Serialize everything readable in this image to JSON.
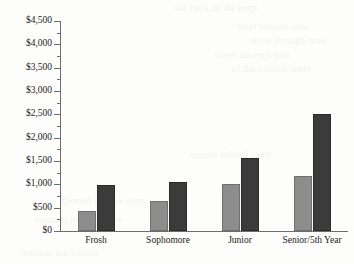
{
  "chart_data": {
    "type": "bar",
    "title": "",
    "subtitle": "",
    "xlabel": "",
    "ylabel": "",
    "categories": [
      "Frosh",
      "Sophomore",
      "Junior",
      "Senior/5th Year"
    ],
    "series": [
      {
        "name": "series-1",
        "color": "#8d8d8d",
        "values": [
          420,
          640,
          1010,
          1170
        ]
      },
      {
        "name": "series-2",
        "color": "#3b3b3b",
        "values": [
          980,
          1060,
          1560,
          2510
        ]
      }
    ],
    "ylim": [
      0,
      4500
    ],
    "ytick_values": [
      0,
      500,
      1000,
      1500,
      2000,
      2500,
      3000,
      3500,
      4000,
      4500
    ],
    "ytick_labels": [
      "$0",
      "$500",
      "$1,000",
      "$1,500",
      "$2,000",
      "$2,500",
      "$3,000",
      "$3,500",
      "$4,000",
      "$4,500"
    ],
    "minor_ticks": true,
    "grid": false,
    "legend": null,
    "legend_position": "none",
    "annotations": []
  },
  "bleed_text": {
    "lines": [
      "the back of the page",
      "faint reverse side",
      "show through scan",
      "bleed through text",
      "of the printed sheet",
      "visible behind chart",
      "ghosted reverse type",
      "scanned page shadow",
      "residual ink outline"
    ]
  }
}
